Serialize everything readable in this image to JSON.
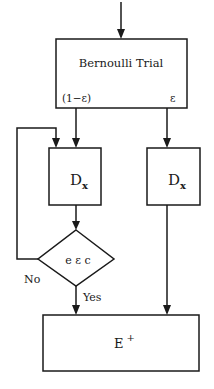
{
  "diagram": {
    "type": "flowchart",
    "colors": {
      "stroke": "#1a1a1a",
      "background": "#ffffff"
    },
    "nodes": {
      "bernoulli": {
        "label": "Bernoulli Trial",
        "left_output": "(1−ε)",
        "right_output": "ε"
      },
      "dx_left": {
        "label_main": "D",
        "label_sub": "x"
      },
      "dx_right": {
        "label_main": "D",
        "label_sub": "x"
      },
      "decision": {
        "label": "e ε c",
        "no_label": "No",
        "yes_label": "Yes"
      },
      "eplus": {
        "label_main": "E",
        "label_sup": "+"
      }
    }
  }
}
